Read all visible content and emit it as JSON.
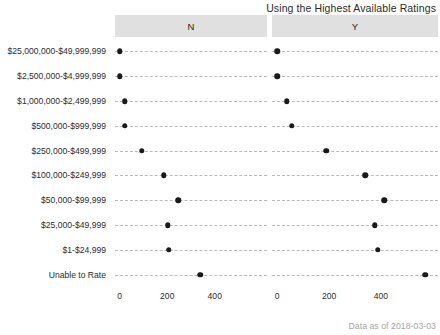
{
  "chart_data": {
    "type": "scatter",
    "title": "Using the Highest Available Ratings",
    "caption": "Data as of 2018-03-03",
    "xlabel": "",
    "ylabel": "",
    "xlim": [
      -20,
      620
    ],
    "grid": true,
    "legend": "none",
    "facet_variable": "Using the Highest Available Ratings",
    "facets": [
      {
        "key": "N",
        "label": "N"
      },
      {
        "key": "Y",
        "label": "Y"
      }
    ],
    "categories": [
      "$25,000,000-$49,999,999",
      "$2,500,000-$4,999,999",
      "$1,000,000-$2,499,999",
      "$500,000-$999,999",
      "$250,000-$499,999",
      "$100,000-$249,999",
      "$50,000-$99,999",
      "$25,000-$49,999",
      "$1-$24,999",
      "Unable to Rate"
    ],
    "series": [
      {
        "name": "N",
        "values": [
          0,
          0,
          20,
          20,
          93,
          186,
          247,
          202,
          206,
          339
        ]
      },
      {
        "name": "Y",
        "values": [
          0,
          0,
          36,
          57,
          190,
          340,
          412,
          376,
          388,
          570
        ]
      }
    ],
    "xticks_n": [
      {
        "value": 0,
        "label": "0"
      },
      {
        "value": 200,
        "label": "200"
      },
      {
        "value": 400,
        "label": "400"
      }
    ],
    "xticks_y": [
      {
        "value": 0,
        "label": "0"
      },
      {
        "value": 200,
        "label": "200"
      },
      {
        "value": 400,
        "label": "400"
      }
    ],
    "colors": {
      "dot": "#1a1a1a",
      "gridline": "#b9b9b9",
      "strip_background": "#e0e0e0",
      "caption": "#a6a6a6",
      "text": "#2b2b2b",
      "background": "#ffffff"
    }
  }
}
